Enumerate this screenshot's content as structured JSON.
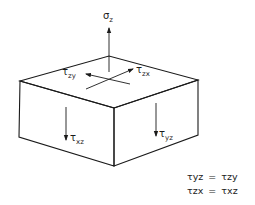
{
  "diagram": {
    "type": "stress-element-3d",
    "colors": {
      "line": "#1a1a1a",
      "background": "#ffffff"
    },
    "labels": {
      "normal_stress": {
        "symbol": "σ",
        "subscript": "z"
      },
      "top_shear_zy": {
        "symbol": "τ",
        "subscript": "zy"
      },
      "top_shear_zx": {
        "symbol": "τ",
        "subscript": "zx"
      },
      "front_left_shear": {
        "symbol": "τ",
        "subscript": "xz"
      },
      "front_right_shear": {
        "symbol": "τ",
        "subscript": "yz"
      }
    },
    "equations": [
      {
        "lhs": "τyz",
        "op": "=",
        "rhs": "τzy"
      },
      {
        "lhs": "τzx",
        "op": "=",
        "rhs": "τxz"
      }
    ]
  }
}
